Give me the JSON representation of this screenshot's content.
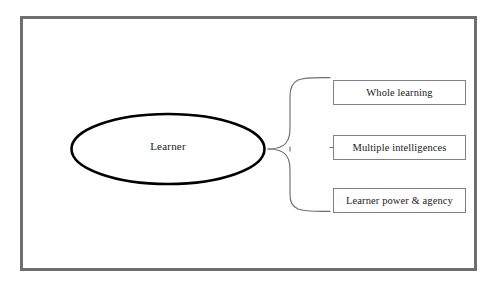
{
  "diagram": {
    "frame": {
      "border_color": "#6e6e6e",
      "background": "#ffffff"
    },
    "central_node": {
      "label": "Learner",
      "shape": "ellipse",
      "stroke_color": "#000000"
    },
    "connector": {
      "type": "curly-brace",
      "orientation": "left-pointing",
      "stroke_color": "#6e6e6e"
    },
    "branches": [
      {
        "label": "Whole learning"
      },
      {
        "label": "Multiple intelligences"
      },
      {
        "label": "Learner power & agency"
      }
    ]
  }
}
